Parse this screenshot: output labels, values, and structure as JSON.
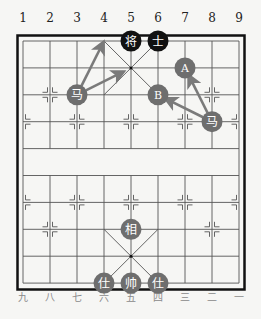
{
  "board": {
    "top_labels": [
      "1",
      "2",
      "3",
      "4",
      "5",
      "6",
      "7",
      "8",
      "9"
    ],
    "bottom_labels": [
      "九",
      "八",
      "七",
      "六",
      "五",
      "四",
      "三",
      "二",
      "一"
    ],
    "colors": {
      "background": "#f6f6f4",
      "grid": "#555555",
      "border": "#111111",
      "black_piece": "#111111",
      "red_piece": "#6e6e6e",
      "piece_text": "#ffffff",
      "arrow": "#7a7a7a",
      "label_top": "#222222",
      "label_bottom": "#8a8a8a"
    }
  },
  "pieces": [
    {
      "glyph": "将",
      "side": "black",
      "col": 5,
      "row": 0
    },
    {
      "glyph": "士",
      "side": "black",
      "col": 6,
      "row": 0
    },
    {
      "glyph": "马",
      "side": "red",
      "col": 3,
      "row": 2
    },
    {
      "glyph": "A",
      "side": "marker",
      "col": 7,
      "row": 1
    },
    {
      "glyph": "B",
      "side": "marker",
      "col": 6,
      "row": 2
    },
    {
      "glyph": "马",
      "side": "red",
      "col": 8,
      "row": 3
    },
    {
      "glyph": "相",
      "side": "red",
      "col": 5,
      "row": 7
    },
    {
      "glyph": "仕",
      "side": "red",
      "col": 4,
      "row": 9
    },
    {
      "glyph": "帅",
      "side": "red",
      "col": 5,
      "row": 9
    },
    {
      "glyph": "仕",
      "side": "red",
      "col": 6,
      "row": 9
    }
  ],
  "arrows": [
    {
      "from": [
        3,
        2
      ],
      "to": [
        4,
        0
      ]
    },
    {
      "from": [
        3,
        2
      ],
      "to": [
        5,
        1
      ]
    },
    {
      "from": [
        8,
        3
      ],
      "to": [
        7,
        1
      ]
    },
    {
      "from": [
        8,
        3
      ],
      "to": [
        6,
        2
      ]
    }
  ]
}
